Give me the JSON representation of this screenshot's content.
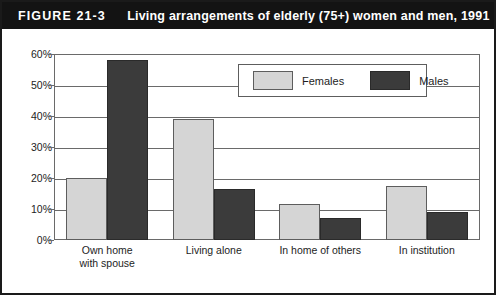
{
  "figure": {
    "label": "FIGURE 21-3",
    "title": "Living arrangements of elderly (75+) women and men, 1991"
  },
  "legend": {
    "females_label": "Females",
    "males_label": "Males",
    "females_color": "#d5d5d5",
    "males_color": "#3b3b3b"
  },
  "axis": {
    "y_ticks": [
      "60%",
      "50%",
      "40%",
      "30%",
      "20%",
      "10%",
      "0%"
    ]
  },
  "chart_data": {
    "type": "bar",
    "title": "Living arrangements of elderly (75+) women and men, 1991",
    "xlabel": "",
    "ylabel": "",
    "ylim": [
      0,
      60
    ],
    "ytick_values": [
      0,
      10,
      20,
      30,
      40,
      50,
      60
    ],
    "ytick_labels": [
      "0%",
      "10%",
      "20%",
      "30%",
      "40%",
      "50%",
      "60%"
    ],
    "grid": true,
    "legend_position": "top-right inside plot",
    "categories": [
      "Own home with spouse",
      "Living alone",
      "In home of others",
      "In institution"
    ],
    "series": [
      {
        "name": "Females",
        "color": "#d5d5d5",
        "values": [
          20,
          39,
          11.5,
          17.5
        ]
      },
      {
        "name": "Males",
        "color": "#3b3b3b",
        "values": [
          58,
          16.5,
          7,
          9
        ]
      }
    ]
  }
}
